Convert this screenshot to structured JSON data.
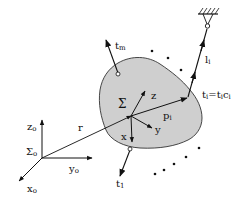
{
  "diagram": {
    "type": "rigid-body-cable-diagram",
    "colors": {
      "body_fill": "#cfcfcf",
      "stroke": "#111111",
      "background": "#ffffff"
    },
    "world_frame": {
      "name": "Σo",
      "name_base": "Σ",
      "name_sub": "o",
      "axes": [
        {
          "id": "zo",
          "base": "z",
          "sub": "o"
        },
        {
          "id": "yo",
          "base": "y",
          "sub": "o"
        },
        {
          "id": "xo",
          "base": "x",
          "sub": "o"
        }
      ]
    },
    "position_vector": {
      "label": "r"
    },
    "body_frame": {
      "name": "Σ",
      "axes": [
        {
          "id": "z",
          "label": "z"
        },
        {
          "id": "y",
          "label": "y"
        },
        {
          "id": "x",
          "label": "x"
        }
      ]
    },
    "attachment_vector": {
      "label_base": "p",
      "label_sub": "i"
    },
    "cables": [
      {
        "id": "tm",
        "base": "t",
        "sub": "m"
      },
      {
        "id": "t1",
        "base": "t",
        "sub": "1"
      },
      {
        "id": "ti",
        "base": "t",
        "sub": "i",
        "eq": "=t",
        "eq_sub": "i",
        "c": "c",
        "c_sub": "i"
      }
    ],
    "cable_length": {
      "base": "l",
      "sub": "i"
    },
    "anchor": {
      "name": "fixed-ground-anchor"
    }
  }
}
